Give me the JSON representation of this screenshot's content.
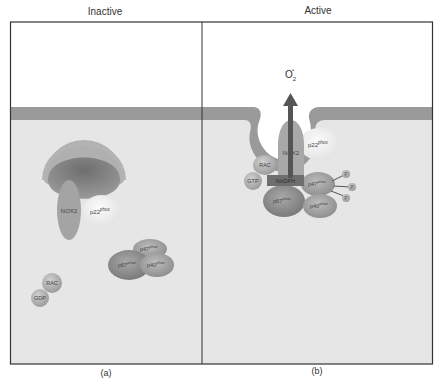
{
  "panels": {
    "left": {
      "title": "Inactive",
      "label": "(a)"
    },
    "right": {
      "title": "Active",
      "label": "(b)"
    }
  },
  "inactive": {
    "nox2": "NOX2",
    "p22": {
      "base": "p22",
      "sup": "phox"
    },
    "p47": {
      "base": "p47",
      "sup": "phox"
    },
    "p67": {
      "base": "p67",
      "sup": "phox"
    },
    "p40": {
      "base": "p40",
      "sup": "phox"
    },
    "rac": "RAC",
    "gdp": "GDP"
  },
  "active": {
    "product": {
      "base": "O",
      "sub": "2",
      "sup": "•"
    },
    "nox2": "NOX2",
    "p22": {
      "base": "p22",
      "sup": "phox"
    },
    "rac": "RAC",
    "gtp": "GTP",
    "nadph": "NADPH",
    "p47": {
      "base": "p47",
      "sup": "phox"
    },
    "p67": {
      "base": "p67",
      "sup": "phox"
    },
    "p40": {
      "base": "p40",
      "sup": "phox"
    },
    "phosphates": [
      "P",
      "P",
      "P"
    ]
  },
  "colors": {
    "membrane": "#9a9a9a",
    "cytoplasm": "#e6e6e6",
    "extracellular": "#ffffff",
    "frame": "#333333",
    "arrow": "#555555",
    "nadph_box": "#6e6e6e"
  }
}
